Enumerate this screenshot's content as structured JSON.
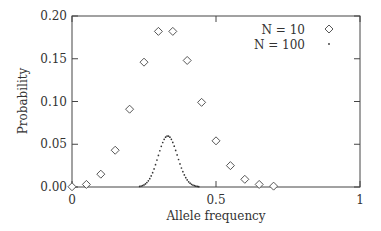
{
  "chart_data": {
    "type": "scatter",
    "title": "",
    "xlabel": "Allele frequency",
    "ylabel": "Probability",
    "xlim": [
      0,
      1
    ],
    "ylim": [
      0,
      0.2
    ],
    "xticks": [
      "0",
      "0.5",
      "1"
    ],
    "yticks": [
      "0.00",
      "0.05",
      "0.10",
      "0.15",
      "0.20"
    ],
    "grid": false,
    "legend_position": "upper right",
    "series": [
      {
        "name": "N = 10",
        "marker": "diamond",
        "x": [
          0,
          0.05,
          0.1,
          0.15,
          0.2,
          0.25,
          0.3,
          0.35,
          0.4,
          0.45,
          0.5,
          0.55,
          0.6,
          0.65,
          0.7
        ],
        "y": [
          0.0003,
          0.003,
          0.015,
          0.043,
          0.091,
          0.146,
          0.182,
          0.182,
          0.148,
          0.099,
          0.054,
          0.025,
          0.009,
          0.003,
          0.001
        ]
      },
      {
        "name": "N = 100",
        "marker": "dot",
        "distribution": "binomial(200, 1/3) / 200",
        "peak_x": 0.333,
        "peak_y": 0.06,
        "x_range": [
          0.24,
          0.43
        ]
      }
    ]
  },
  "labels": {
    "xlabel": "Allele frequency",
    "ylabel": "Probability",
    "legend_n10": "N = 10",
    "legend_n100": "N = 100"
  }
}
